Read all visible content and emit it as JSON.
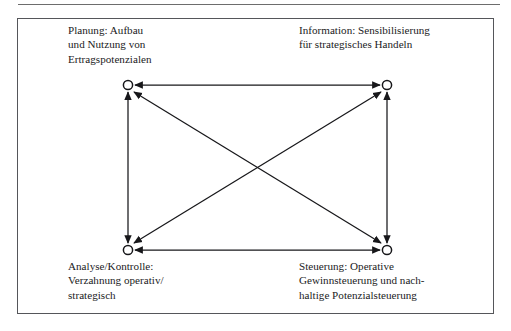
{
  "figure": {
    "frame": {
      "border_color": "#55565a",
      "background": "#ffffff"
    },
    "top_rule_color": "#6d6d6d",
    "line_color": "#17171a"
  },
  "nodes": [
    {
      "id": "planung",
      "position": "top-left",
      "label": "Planung: Aufbau\nund Nutzung von\nErtragspotenzialen",
      "cx": 128,
      "cy": 85
    },
    {
      "id": "information",
      "position": "top-right",
      "label": "Information: Sensibilisierung\nfür strategisches Handeln",
      "cx": 387,
      "cy": 85
    },
    {
      "id": "analyse-kontrolle",
      "position": "bottom-left",
      "label": "Analyse/Kontrolle:\nVerzahnung operativ/\nstrategisch",
      "cx": 128,
      "cy": 250
    },
    {
      "id": "steuerung",
      "position": "bottom-right",
      "label": "Steuerung: Operative\nGewinnsteuerung und nach-\nhaltige Potenzialsteuerung",
      "cx": 387,
      "cy": 250
    }
  ],
  "edges": [
    {
      "id": "top-horizontal",
      "from": "planung",
      "to": "information",
      "style": "double-headed"
    },
    {
      "id": "bottom-horizontal",
      "from": "analyse-kontrolle",
      "to": "steuerung",
      "style": "double-headed"
    },
    {
      "id": "left-vertical",
      "from": "planung",
      "to": "analyse-kontrolle",
      "style": "double-headed"
    },
    {
      "id": "right-vertical",
      "from": "information",
      "to": "steuerung",
      "style": "double-headed"
    },
    {
      "id": "diagonal-tl-br",
      "from": "planung",
      "to": "steuerung",
      "style": "double-headed"
    },
    {
      "id": "diagonal-tr-bl",
      "from": "information",
      "to": "analyse-kontrolle",
      "style": "double-headed"
    }
  ]
}
